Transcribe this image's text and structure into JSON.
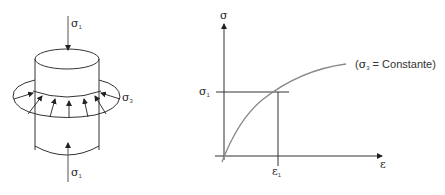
{
  "left_figure": {
    "title": "Triaxial specimen under confining pressure",
    "top_load": {
      "symbol": "σ",
      "subscript": "1"
    },
    "bottom_load": {
      "symbol": "σ",
      "subscript": "1"
    },
    "confining_pressure": {
      "symbol": "σ",
      "subscript": "3"
    }
  },
  "right_figure": {
    "y_axis_label": "σ",
    "x_axis_label": "ε",
    "y_marker": {
      "symbol": "σ",
      "subscript": "1"
    },
    "x_marker": {
      "symbol": "ε",
      "subscript": "1"
    },
    "curve_label": {
      "open": "(",
      "symbol": "σ",
      "subscript": "3",
      "rest": " = Constante)"
    }
  },
  "colors": {
    "line": "#333333",
    "curve": "#888888",
    "background": "#ffffff"
  }
}
